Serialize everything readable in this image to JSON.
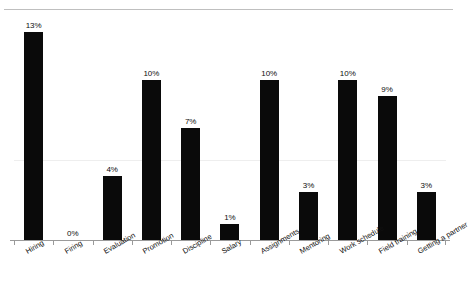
{
  "chart_data": {
    "type": "bar",
    "title": "",
    "subtitle": "",
    "xlabel": "",
    "ylabel": "",
    "ylim": [
      0,
      14
    ],
    "grid": false,
    "legend": null,
    "value_suffix": "%",
    "categories": [
      "Hiring",
      "Firing",
      "Evaluation",
      "Promotion",
      "Discipline",
      "Salary",
      "Assignments",
      "Mentoring",
      "Work schedule",
      "Field training",
      "Getting a partner"
    ],
    "values": [
      13,
      0,
      4,
      10,
      7,
      1,
      10,
      3,
      10,
      9,
      3
    ],
    "value_labels": [
      "13%",
      "0%",
      "4%",
      "10%",
      "7%",
      "1%",
      "10%",
      "3%",
      "10%",
      "9%",
      "3%"
    ],
    "bar_color": "#0a0a0a",
    "axis_color": "#9a9a9a",
    "label_color": "#101010"
  },
  "decor": {
    "top_rule_color": "#bfbfbf",
    "grid_line_color": "#eeeeee"
  }
}
